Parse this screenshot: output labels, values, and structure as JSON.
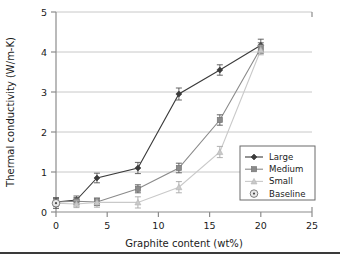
{
  "chart_data": {
    "type": "line",
    "title": "",
    "xlabel": "Graphite content (wt%)",
    "ylabel": "Thermal conductivity (W/m-K)",
    "xlim": [
      0,
      25
    ],
    "ylim": [
      0,
      5
    ],
    "xticks": [
      0,
      5,
      10,
      15,
      20,
      25
    ],
    "yticks": [
      0,
      1,
      2,
      3,
      4,
      5
    ],
    "xtick_labels": [
      "0",
      "5",
      "10",
      "15",
      "20",
      "25"
    ],
    "ytick_labels": [
      "0",
      "1",
      "2",
      "3",
      "4",
      "5"
    ],
    "grid": "horizontal",
    "legend_position": "lower-right-inside",
    "series": [
      {
        "name": "Large",
        "color": "#3b3b3b",
        "marker": "diamond",
        "x": [
          0,
          2,
          4,
          8,
          12,
          16,
          20
        ],
        "y": [
          0.25,
          0.3,
          0.85,
          1.1,
          2.95,
          3.55,
          4.17
        ],
        "yerr": [
          0.1,
          0.1,
          0.12,
          0.14,
          0.15,
          0.13,
          0.15
        ]
      },
      {
        "name": "Medium",
        "color": "#8a8a8a",
        "marker": "square",
        "x": [
          0,
          2,
          4,
          8,
          12,
          16,
          20
        ],
        "y": [
          0.25,
          0.27,
          0.25,
          0.58,
          1.1,
          2.3,
          4.1
        ],
        "yerr": [
          0.1,
          0.09,
          0.09,
          0.1,
          0.12,
          0.13,
          0.13
        ]
      },
      {
        "name": "Small",
        "color": "#c9c9c9",
        "marker": "triangle",
        "x": [
          0,
          2,
          4,
          8,
          12,
          16,
          20
        ],
        "y": [
          0.22,
          0.2,
          0.24,
          0.24,
          0.62,
          1.5,
          4.05
        ],
        "yerr": [
          0.09,
          0.09,
          0.12,
          0.14,
          0.14,
          0.14,
          0.12
        ]
      },
      {
        "name": "Baseline",
        "color": "#9a9a9a",
        "marker": "circle-dot",
        "x": [
          0
        ],
        "y": [
          0.22
        ],
        "yerr": [
          0.13
        ]
      }
    ],
    "legend_entries": [
      {
        "label": "Large",
        "marker": "diamond",
        "color": "#3b3b3b",
        "line": true
      },
      {
        "label": "Medium",
        "marker": "square",
        "color": "#8a8a8a",
        "line": true
      },
      {
        "label": "Small",
        "marker": "triangle",
        "color": "#c9c9c9",
        "line": true
      },
      {
        "label": "Baseline",
        "marker": "circle-dot",
        "color": "#7a7a7a",
        "line": false
      }
    ]
  },
  "style": {
    "axis_color": "#8c8c8c",
    "grid_color": "#c8c8c8",
    "text_color": "#1a1a1a",
    "plot_background": "#ffffff",
    "legend_border": "#6b6b6b",
    "rule_color": "#3a3a3a"
  }
}
